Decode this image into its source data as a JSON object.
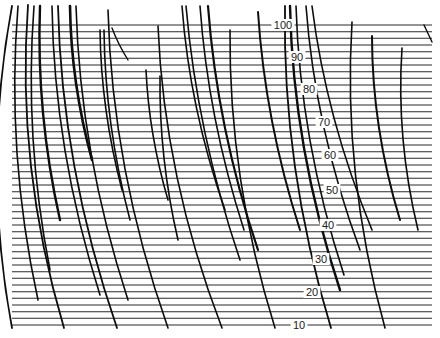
{
  "figure": {
    "width": 440,
    "height": 338,
    "background": "#ffffff",
    "line_color": "#2a2a2a",
    "arc_color": "#0d0d0d"
  },
  "scale": {
    "min": 10,
    "max": 100,
    "y_at_min": 325,
    "y_at_max": 25,
    "line_step": 2,
    "x_start": 12,
    "x_end": 432,
    "labels": [
      {
        "value": "100",
        "x": 283,
        "y": 25
      },
      {
        "value": "90",
        "x": 297,
        "y": 57
      },
      {
        "value": "80",
        "x": 309,
        "y": 89
      },
      {
        "value": "70",
        "x": 324,
        "y": 122
      },
      {
        "value": "60",
        "x": 330,
        "y": 155
      },
      {
        "value": "50",
        "x": 332,
        "y": 190
      },
      {
        "value": "40",
        "x": 328,
        "y": 225
      },
      {
        "value": "30",
        "x": 321,
        "y": 259
      },
      {
        "value": "20",
        "x": 312,
        "y": 292
      },
      {
        "value": "10",
        "x": 299,
        "y": 325
      }
    ]
  },
  "arcs": [
    {
      "x0": 12,
      "y0": 6,
      "x1": 12,
      "y1": 328,
      "bend": 30,
      "w": 1.8
    },
    {
      "x0": 18,
      "y0": 6,
      "x1": 38,
      "y1": 300,
      "bend": 22,
      "w": 1.6
    },
    {
      "x0": 28,
      "y0": 5,
      "x1": 64,
      "y1": 328,
      "bend": 30,
      "w": 1.8
    },
    {
      "x0": 34,
      "y0": 6,
      "x1": 50,
      "y1": 270,
      "bend": 18,
      "w": 1.6
    },
    {
      "x0": 40,
      "y0": 6,
      "x1": 60,
      "y1": 220,
      "bend": 14,
      "w": 2.4
    },
    {
      "x0": 52,
      "y0": 6,
      "x1": 100,
      "y1": 295,
      "bend": 22,
      "w": 1.6
    },
    {
      "x0": 58,
      "y0": 6,
      "x1": 117,
      "y1": 328,
      "bend": 26,
      "w": 1.8
    },
    {
      "x0": 70,
      "y0": 6,
      "x1": 92,
      "y1": 160,
      "bend": 10,
      "w": 2.6
    },
    {
      "x0": 76,
      "y0": 6,
      "x1": 128,
      "y1": 300,
      "bend": 22,
      "w": 1.6
    },
    {
      "x0": 108,
      "y0": 10,
      "x1": 168,
      "y1": 328,
      "bend": 26,
      "w": 1.6
    },
    {
      "x0": 100,
      "y0": 30,
      "x1": 122,
      "y1": 190,
      "bend": 10,
      "w": 1.6
    },
    {
      "x0": 104,
      "y0": 30,
      "x1": 130,
      "y1": 220,
      "bend": 12,
      "w": 1.6
    },
    {
      "x0": 158,
      "y0": 26,
      "x1": 222,
      "y1": 328,
      "bend": 26,
      "w": 1.6
    },
    {
      "x0": 146,
      "y0": 70,
      "x1": 168,
      "y1": 200,
      "bend": 8,
      "w": 1.6
    },
    {
      "x0": 160,
      "y0": 76,
      "x1": 178,
      "y1": 240,
      "bend": 10,
      "w": 1.6
    },
    {
      "x0": 182,
      "y0": 6,
      "x1": 225,
      "y1": 210,
      "bend": 14,
      "w": 1.6
    },
    {
      "x0": 186,
      "y0": 6,
      "x1": 240,
      "y1": 260,
      "bend": 16,
      "w": 1.6
    },
    {
      "x0": 200,
      "y0": 6,
      "x1": 244,
      "y1": 230,
      "bend": 14,
      "w": 1.6
    },
    {
      "x0": 208,
      "y0": 6,
      "x1": 258,
      "y1": 250,
      "bend": 16,
      "w": 2.2
    },
    {
      "x0": 230,
      "y0": 30,
      "x1": 275,
      "y1": 328,
      "bend": 24,
      "w": 1.6
    },
    {
      "x0": 258,
      "y0": 12,
      "x1": 300,
      "y1": 230,
      "bend": 14,
      "w": 2.0
    },
    {
      "x0": 285,
      "y0": 6,
      "x1": 331,
      "y1": 328,
      "bend": 26,
      "w": 1.8
    },
    {
      "x0": 290,
      "y0": 6,
      "x1": 340,
      "y1": 290,
      "bend": 22,
      "w": 2.4
    },
    {
      "x0": 296,
      "y0": 6,
      "x1": 344,
      "y1": 275,
      "bend": 20,
      "w": 1.6
    },
    {
      "x0": 306,
      "y0": 6,
      "x1": 360,
      "y1": 250,
      "bend": 18,
      "w": 1.6
    },
    {
      "x0": 312,
      "y0": 6,
      "x1": 372,
      "y1": 230,
      "bend": 16,
      "w": 1.6
    },
    {
      "x0": 352,
      "y0": 22,
      "x1": 385,
      "y1": 328,
      "bend": 26,
      "w": 1.6
    },
    {
      "x0": 372,
      "y0": 36,
      "x1": 400,
      "y1": 220,
      "bend": 14,
      "w": 2.0
    },
    {
      "x0": 402,
      "y0": 48,
      "x1": 418,
      "y1": 230,
      "bend": 14,
      "w": 1.6
    },
    {
      "x0": 424,
      "y0": 25,
      "x1": 432,
      "y1": 42,
      "bend": 0,
      "w": 1.4
    },
    {
      "x0": 112,
      "y0": 28,
      "x1": 128,
      "y1": 60,
      "bend": 2,
      "w": 1.4
    }
  ]
}
